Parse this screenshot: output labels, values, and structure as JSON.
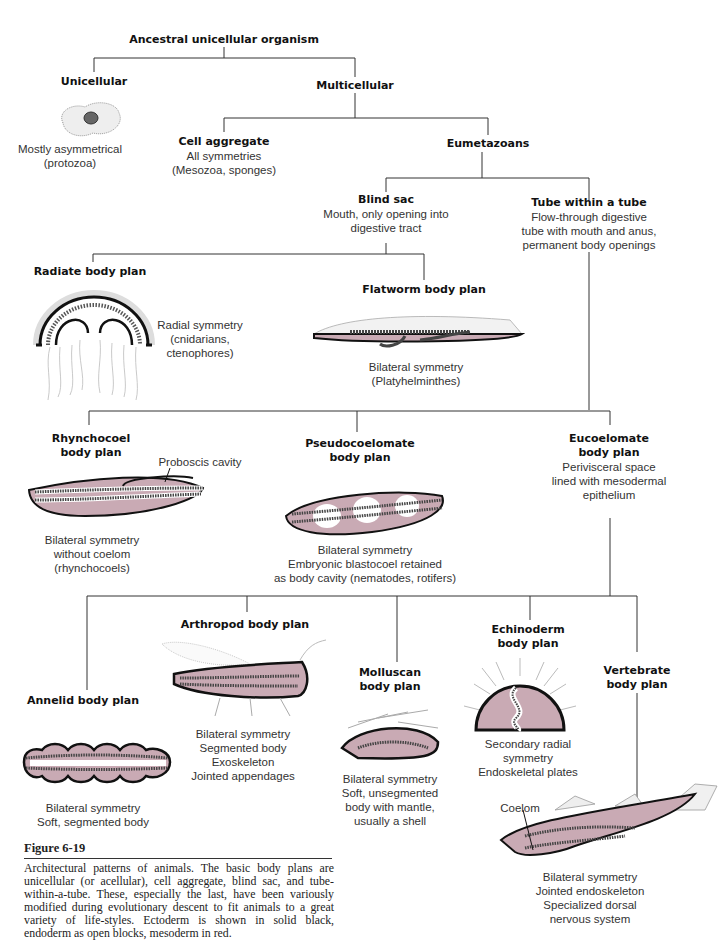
{
  "colors": {
    "mesoderm": "#c9aab4",
    "ectoderm": "#111111",
    "line": "#333333"
  },
  "nodes": {
    "root": {
      "title": "Ancestral unicellular organism"
    },
    "unicellular": {
      "title": "Unicellular",
      "desc": [
        "Mostly asymmetrical",
        "(protozoa)"
      ]
    },
    "multicellular": {
      "title": "Multicellular"
    },
    "cell_aggregate": {
      "title": "Cell aggregate",
      "desc": [
        "All symmetries",
        "(Mesozoa, sponges)"
      ]
    },
    "eumetazoans": {
      "title": "Eumetazoans"
    },
    "blind_sac": {
      "title": "Blind sac",
      "desc": [
        "Mouth, only opening into",
        "digestive tract"
      ]
    },
    "tube_within_tube": {
      "title": "Tube within a tube",
      "desc": [
        "Flow-through digestive",
        "tube with mouth and anus,",
        "permanent body openings"
      ]
    },
    "radiate": {
      "title": "Radiate body plan",
      "desc": [
        "Radial symmetry",
        "(cnidarians,",
        "ctenophores)"
      ]
    },
    "flatworm": {
      "title": "Flatworm body plan",
      "desc": [
        "Bilateral symmetry",
        "(Platyhelminthes)"
      ]
    },
    "rhynchocoel": {
      "title": [
        "Rhynchocoel",
        "body plan"
      ],
      "annotation": "Proboscis cavity",
      "desc": [
        "Bilateral symmetry",
        "without coelom",
        "(rhynchocoels)"
      ]
    },
    "pseudocoelomate": {
      "title": [
        "Pseudocoelomate",
        "body plan"
      ],
      "desc": [
        "Bilateral symmetry",
        "Embryonic blastocoel retained",
        "as body cavity (nematodes, rotifers)"
      ]
    },
    "eucoelomate": {
      "title": [
        "Eucoelomate",
        "body plan"
      ],
      "desc": [
        "Perivisceral space",
        "lined with mesodermal",
        "epithelium"
      ]
    },
    "annelid": {
      "title": "Annelid body plan",
      "desc": [
        "Bilateral symmetry",
        "Soft, segmented body"
      ]
    },
    "arthropod": {
      "title": "Arthropod body plan",
      "desc": [
        "Bilateral symmetry",
        "Segmented body",
        "Exoskeleton",
        "Jointed appendages"
      ]
    },
    "molluscan": {
      "title": [
        "Molluscan",
        "body plan"
      ],
      "desc": [
        "Bilateral symmetry",
        "Soft, unsegmented",
        "body with mantle,",
        "usually a shell"
      ]
    },
    "echinoderm": {
      "title": [
        "Echinoderm",
        "body plan"
      ],
      "desc": [
        "Secondary radial",
        "symmetry",
        "Endoskeletal plates"
      ]
    },
    "vertebrate": {
      "title": [
        "Vertebrate",
        "body plan"
      ],
      "annotation": "Coelom",
      "desc": [
        "Bilateral symmetry",
        "Jointed endoskeleton",
        "Specialized dorsal",
        "nervous system"
      ]
    }
  },
  "figure": {
    "title": "Figure 6-19",
    "caption": "Architectural patterns of animals. The basic body plans are unicellular (or acellular), cell aggregate, blind sac, and tube-within-a-tube. These, especially the last, have been variously modified during evolutionary descent to fit animals to a great variety of life-styles. Ectoderm is shown in solid black, endoderm as open blocks, mesoderm in red."
  }
}
